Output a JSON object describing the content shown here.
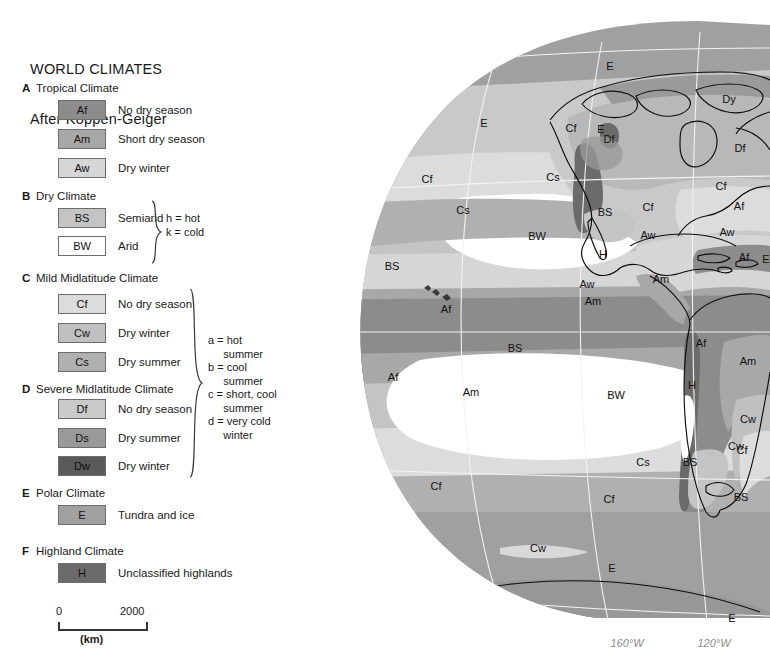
{
  "legend": {
    "title_line1": "WORLD CLIMATES",
    "title_line2": "After Köppen-Geiger",
    "categories": [
      {
        "letter": "A",
        "name": "Tropical Climate",
        "items": [
          {
            "code": "Af",
            "label": "No dry season",
            "color": "#8c8c8c"
          },
          {
            "code": "Am",
            "label": "Short dry season",
            "color": "#a8a8a8"
          },
          {
            "code": "Aw",
            "label": "Dry winter",
            "color": "#d6d6d6"
          }
        ]
      },
      {
        "letter": "B",
        "name": "Dry Climate",
        "items": [
          {
            "code": "BS",
            "label": "Semiarid",
            "color": "#c4c4c4"
          },
          {
            "code": "BW",
            "label": "Arid",
            "color": "#ffffff"
          }
        ],
        "note": "h = hot\nk = cold"
      },
      {
        "letter": "C",
        "name": "Mild Midlatitude Climate",
        "items": [
          {
            "code": "Cf",
            "label": "No dry season",
            "color": "#dcdcdc"
          },
          {
            "code": "Cw",
            "label": "Dry winter",
            "color": "#c0c0c0"
          },
          {
            "code": "Cs",
            "label": "Dry summer",
            "color": "#b0b0b0"
          }
        ]
      },
      {
        "letter": "D",
        "name": "Severe Midlatitude  Climate",
        "items": [
          {
            "code": "Df",
            "label": "No dry season",
            "color": "#c9c9c9"
          },
          {
            "code": "Ds",
            "label": "Dry summer",
            "color": "#9a9a9a"
          },
          {
            "code": "Dw",
            "label": "Dry winter",
            "color": "#5a5a5a"
          }
        ],
        "note": "a = hot\n     summer\nb = cool\n     summer\nc = short, cool\n     summer\nd = very cold\n     winter"
      },
      {
        "letter": "E",
        "name": "Polar Climate",
        "items": [
          {
            "code": "E",
            "label": "Tundra and ice",
            "color": "#a0a0a0"
          }
        ]
      },
      {
        "letter": "F",
        "name": "Highland Climate",
        "items": [
          {
            "code": "H",
            "label": "Unclassified highlands",
            "color": "#6b6b6b"
          }
        ]
      }
    ],
    "scale": {
      "min": "0",
      "max": "2000",
      "units": "(km)"
    }
  },
  "map": {
    "longitude_labels": [
      {
        "text": "160°W",
        "x": 327,
        "y": 647
      },
      {
        "text": "120°W",
        "x": 414,
        "y": 647
      }
    ],
    "climate_labels": [
      {
        "text": "E",
        "x": 310,
        "y": 70
      },
      {
        "text": "E",
        "x": 184,
        "y": 127
      },
      {
        "text": "Dy",
        "x": 429,
        "y": 103
      },
      {
        "text": "E",
        "x": 301,
        "y": 133
      },
      {
        "text": "Cf",
        "x": 127,
        "y": 183
      },
      {
        "text": "Cs",
        "x": 253,
        "y": 181
      },
      {
        "text": "Cf",
        "x": 271,
        "y": 132
      },
      {
        "text": "Df",
        "x": 309,
        "y": 143
      },
      {
        "text": "Df",
        "x": 440,
        "y": 152
      },
      {
        "text": "Cs",
        "x": 163,
        "y": 214
      },
      {
        "text": "BS",
        "x": 305,
        "y": 216
      },
      {
        "text": "Cf",
        "x": 348,
        "y": 211
      },
      {
        "text": "Cf",
        "x": 421,
        "y": 190
      },
      {
        "text": "Af",
        "x": 439,
        "y": 210
      },
      {
        "text": "H",
        "x": 303,
        "y": 258
      },
      {
        "text": "BW",
        "x": 237,
        "y": 240
      },
      {
        "text": "BS",
        "x": 92,
        "y": 270
      },
      {
        "text": "Aw",
        "x": 348,
        "y": 239
      },
      {
        "text": "Aw",
        "x": 427,
        "y": 236
      },
      {
        "text": "Af",
        "x": 444,
        "y": 261
      },
      {
        "text": "E",
        "x": 466,
        "y": 263
      },
      {
        "text": "Aw",
        "x": 287,
        "y": 288
      },
      {
        "text": "Am",
        "x": 361,
        "y": 283
      },
      {
        "text": "Am",
        "x": 293,
        "y": 305
      },
      {
        "text": "Af",
        "x": 146,
        "y": 313
      },
      {
        "text": "BS",
        "x": 215,
        "y": 352
      },
      {
        "text": "Af",
        "x": 93,
        "y": 381
      },
      {
        "text": "Af",
        "x": 401,
        "y": 347
      },
      {
        "text": "Am",
        "x": 171,
        "y": 396
      },
      {
        "text": "Am",
        "x": 448,
        "y": 365
      },
      {
        "text": "BW",
        "x": 316,
        "y": 399
      },
      {
        "text": "H",
        "x": 392,
        "y": 389
      },
      {
        "text": "Cw",
        "x": 448,
        "y": 423
      },
      {
        "text": "Cw",
        "x": 436,
        "y": 450
      },
      {
        "text": "Cs",
        "x": 343,
        "y": 466
      },
      {
        "text": "BS",
        "x": 390,
        "y": 466
      },
      {
        "text": "Cf",
        "x": 442,
        "y": 454
      },
      {
        "text": "Cf",
        "x": 309,
        "y": 503
      },
      {
        "text": "Cf",
        "x": 136,
        "y": 490
      },
      {
        "text": "BS",
        "x": 441,
        "y": 501
      },
      {
        "text": "Cw",
        "x": 238,
        "y": 552
      },
      {
        "text": "E",
        "x": 312,
        "y": 572
      },
      {
        "text": "E",
        "x": 432,
        "y": 622
      }
    ]
  },
  "colors": {
    "Af": "#8c8c8c",
    "Am": "#a8a8a8",
    "Aw": "#d6d6d6",
    "BS": "#c4c4c4",
    "BW": "#ffffff",
    "Cf": "#dcdcdc",
    "Cw": "#c0c0c0",
    "Cs": "#b0b0b0",
    "Df": "#c9c9c9",
    "Ds": "#9a9a9a",
    "Dw": "#5a5a5a",
    "E": "#a0a0a0",
    "H": "#6b6b6b",
    "graticule": "#f2f2f2",
    "coastline": "#000000",
    "border": "#6d6d6d"
  }
}
